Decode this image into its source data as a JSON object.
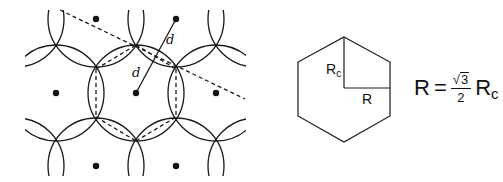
{
  "lattice": {
    "lattice_points": [
      {
        "x": 96,
        "y": 19
      },
      {
        "x": 176,
        "y": 19
      },
      {
        "x": 56,
        "y": 93
      },
      {
        "x": 136,
        "y": 93
      },
      {
        "x": 216,
        "y": 93
      },
      {
        "x": 96,
        "y": 166
      },
      {
        "x": 176,
        "y": 166
      }
    ],
    "spacing_label": "d",
    "spacing_label_2": "d",
    "colors": {
      "stroke": "#1a1a1a",
      "dot": "#111111"
    }
  },
  "hexagon": {
    "circumradius_label": "R",
    "circumradius_subscript": "c",
    "inradius_label": "R"
  },
  "formula": {
    "lhs": "R",
    "equals": "=",
    "sqrt_sign": "√",
    "radicand": "3",
    "denominator": "2",
    "rhs_symbol": "R",
    "rhs_subscript": "c"
  }
}
